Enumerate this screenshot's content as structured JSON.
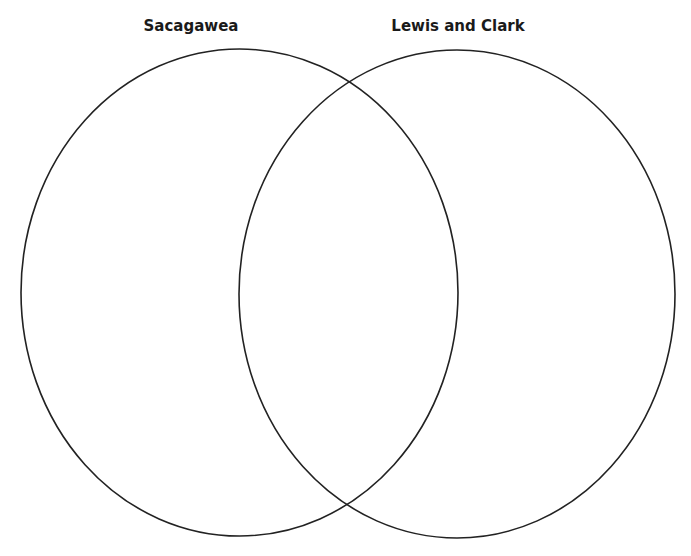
{
  "diagram": {
    "type": "venn",
    "sets": [
      {
        "label": "Sacagawea",
        "cx": 239.5,
        "cy": 292.5,
        "rx": 218.5,
        "ry": 243.5,
        "label_x": 191,
        "label_y": 18
      },
      {
        "label": "Lewis and Clark",
        "cx": 457,
        "cy": 294,
        "rx": 218,
        "ry": 244,
        "label_x": 458,
        "label_y": 18
      }
    ],
    "stroke_color": "#222222",
    "background": "#ffffff"
  }
}
